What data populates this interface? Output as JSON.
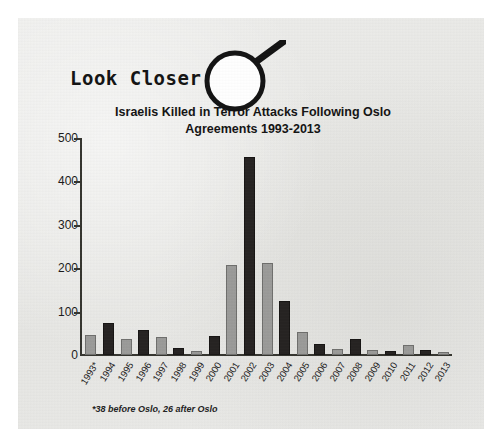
{
  "logo": {
    "text": "Look Closer",
    "magnifier_icon": "magnifying-glass-icon"
  },
  "chart_data": {
    "type": "bar",
    "title": "Israelis Killed in Terror Attacks Following Oslo Agreements 1993-2013",
    "title_line1": "Israelis Killed in Terror Attacks Following Oslo",
    "title_line2": "Agreements 1993-2013",
    "xlabel": "",
    "ylabel": "",
    "ylim": [
      0,
      500
    ],
    "yticks": [
      0,
      100,
      200,
      300,
      400,
      500
    ],
    "grid": false,
    "legend": "none",
    "categories": [
      "1993*",
      "1994",
      "1995",
      "1996",
      "1997",
      "1998",
      "1999",
      "2000",
      "2001",
      "2002",
      "2003",
      "2004",
      "2005",
      "2006",
      "2007",
      "2008",
      "2009",
      "2010",
      "2011",
      "2012",
      "2013"
    ],
    "values": [
      45,
      74,
      36,
      58,
      41,
      16,
      9,
      44,
      208,
      457,
      213,
      125,
      54,
      26,
      13,
      36,
      12,
      10,
      22,
      12,
      7
    ],
    "bar_styles": [
      "light",
      "dark",
      "light",
      "dark",
      "light",
      "dark",
      "light",
      "dark",
      "light",
      "dark",
      "light",
      "dark",
      "light",
      "dark",
      "light",
      "dark",
      "light",
      "dark",
      "light",
      "dark",
      "light"
    ],
    "footnote": "*38 before Oslo, 26 after Oslo",
    "colors": {
      "light_bar": "#9b9b99",
      "dark_bar": "#262322",
      "axis": "#35352f",
      "text": "#1b1b1b",
      "page_background": "#e9e9e7"
    }
  }
}
